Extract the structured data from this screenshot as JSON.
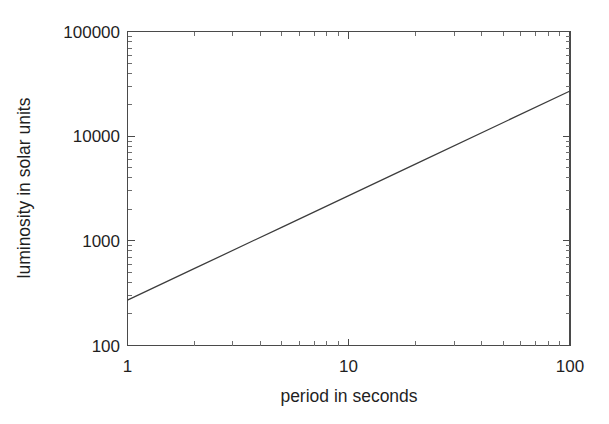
{
  "chart_data": {
    "type": "line",
    "title": "",
    "subtitle": "",
    "xlabel": "period in seconds",
    "ylabel": "luminosity in solar units",
    "xscale": "log",
    "yscale": "log",
    "xlim": [
      1,
      100
    ],
    "ylim": [
      100,
      100000
    ],
    "xticks": [
      1,
      10,
      100
    ],
    "xticklabels": [
      "1",
      "10",
      "100"
    ],
    "yticks": [
      100,
      1000,
      10000,
      100000
    ],
    "yticklabels": [
      "100",
      "1000",
      "10000",
      "100000"
    ],
    "minor_ticks": true,
    "grid": false,
    "legend": null,
    "legend_position": "none",
    "series": [
      {
        "name": "period-luminosity relation",
        "color": "#3c3c3c",
        "x": [
          1,
          2,
          5,
          10,
          20,
          50,
          100
        ],
        "y": [
          270,
          540,
          1350,
          2700,
          5400,
          13500,
          27000
        ],
        "annotation": "straight line on log-log axes; slope = 1 in log-log space"
      }
    ],
    "annotations": []
  },
  "axes": {
    "x_tick_label_1": "1",
    "x_tick_label_2": "10",
    "x_tick_label_3": "100",
    "y_tick_label_1": "100",
    "y_tick_label_2": "1000",
    "y_tick_label_3": "10000",
    "y_tick_label_4": "100000",
    "x_axis_title": "period in seconds",
    "y_axis_title": "luminosity in solar units"
  },
  "colors": {
    "background": "#ffffff",
    "axis": "#4a4a4a",
    "text": "#1f1f1f",
    "line": "#3c3c3c"
  }
}
